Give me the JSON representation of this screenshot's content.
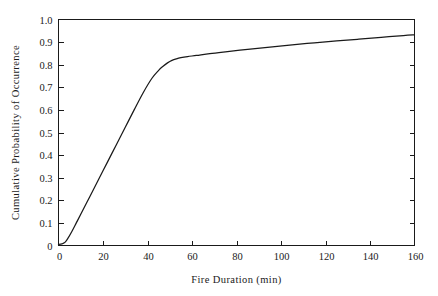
{
  "chart_data": {
    "type": "line",
    "title": "",
    "xlabel": "Fire Duration (min)",
    "ylabel": "Cumulative Probability of Occurrence",
    "xlim": [
      0,
      160
    ],
    "ylim": [
      0,
      1.0
    ],
    "grid": false,
    "legend": null,
    "xticks": [
      0,
      20,
      40,
      60,
      80,
      100,
      120,
      140,
      160
    ],
    "xtick_labels": [
      "0",
      "20",
      "40",
      "60",
      "80",
      "100",
      "120",
      "140",
      "160"
    ],
    "yticks": [
      0,
      0.1,
      0.2,
      0.3,
      0.4,
      0.5,
      0.6,
      0.7,
      0.8,
      0.9,
      1.0
    ],
    "ytick_labels": [
      "0",
      "0.1",
      "0.2",
      "0.3",
      "0.4",
      "0.5",
      "0.6",
      "0.7",
      "0.8",
      "0.9",
      "1.0"
    ],
    "line_color": "#1a1a1a",
    "background_color": "#ffffff",
    "series": [
      {
        "name": "Cumulative probability of occurrence",
        "x": [
          0,
          1,
          2,
          3,
          4,
          6,
          8,
          10,
          14,
          18,
          22,
          26,
          30,
          34,
          38,
          42,
          45,
          47,
          49,
          51,
          53,
          55,
          58,
          62,
          68,
          75,
          85,
          95,
          105,
          115,
          125,
          135,
          145,
          155,
          160
        ],
        "y": [
          0.005,
          0.006,
          0.009,
          0.015,
          0.028,
          0.062,
          0.1,
          0.138,
          0.215,
          0.292,
          0.369,
          0.446,
          0.523,
          0.6,
          0.675,
          0.74,
          0.775,
          0.793,
          0.808,
          0.819,
          0.826,
          0.831,
          0.836,
          0.841,
          0.849,
          0.857,
          0.868,
          0.878,
          0.888,
          0.897,
          0.905,
          0.913,
          0.921,
          0.929,
          0.932
        ]
      }
    ],
    "annotations": []
  },
  "axis_titles": {
    "x": "Fire Duration (min)",
    "y": "Cumulative Probability of Occurrence"
  }
}
